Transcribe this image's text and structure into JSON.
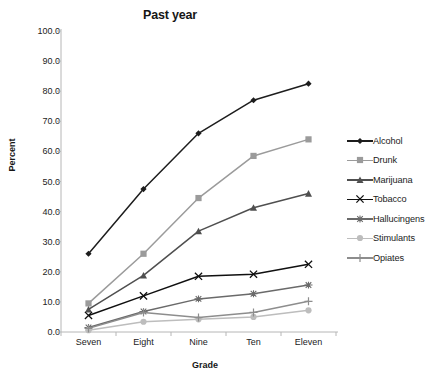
{
  "chart_data": {
    "type": "line",
    "title": "Past year",
    "xlabel": "Grade",
    "ylabel": "Percent",
    "categories": [
      "Seven",
      "Eight",
      "Nine",
      "Ten",
      "Eleven"
    ],
    "ylim": [
      0,
      100
    ],
    "yticks": [
      "0.0",
      "10.0",
      "20.0",
      "30.0",
      "40.0",
      "50.0",
      "60.0",
      "70.0",
      "80.0",
      "90.0",
      "100.0"
    ],
    "ytick_values": [
      0,
      10,
      20,
      30,
      40,
      50,
      60,
      70,
      80,
      90,
      100
    ],
    "grid": false,
    "legend_position": "right",
    "series": [
      {
        "name": "Alcohol",
        "values": [
          26.0,
          47.5,
          66.0,
          77.0,
          82.5
        ],
        "color": "#1d1d1d",
        "marker": "diamond"
      },
      {
        "name": "Drunk",
        "values": [
          9.5,
          26.0,
          44.5,
          58.5,
          64.0
        ],
        "color": "#9b9b9b",
        "marker": "square"
      },
      {
        "name": "Marijuana",
        "values": [
          7.5,
          18.8,
          33.5,
          41.3,
          46.0
        ],
        "color": "#4f4f4f",
        "marker": "triangle"
      },
      {
        "name": "Tobacco",
        "values": [
          5.5,
          12.0,
          18.5,
          19.2,
          22.5
        ],
        "color": "#101010",
        "marker": "cross"
      },
      {
        "name": "Hallucingens",
        "values": [
          1.5,
          6.8,
          11.0,
          12.7,
          15.6
        ],
        "color": "#6a6a6a",
        "marker": "dash"
      },
      {
        "name": "Stimulants",
        "values": [
          0.6,
          3.4,
          4.2,
          5.0,
          7.2
        ],
        "color": "#bdbdbd",
        "marker": "circle"
      },
      {
        "name": "Opiates",
        "values": [
          1.2,
          6.5,
          4.8,
          6.5,
          10.2
        ],
        "color": "#8d8d8d",
        "marker": "plus"
      }
    ]
  },
  "axes": {
    "axis_line_color": "#b6b6b6",
    "tick_color": "#b6b6b6"
  }
}
